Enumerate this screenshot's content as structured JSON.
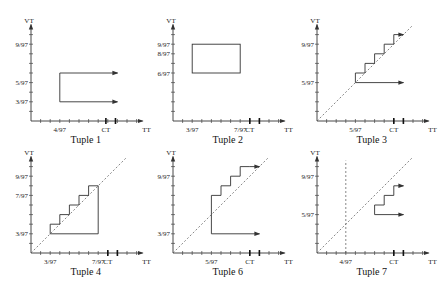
{
  "figure": {
    "axis_labels": {
      "x": "TT",
      "y": "VT",
      "ct": "CT"
    },
    "panels": [
      {
        "id": "tuple-1",
        "title": "Tuple 1",
        "origin": [
          31,
          121
        ],
        "step": 9.6,
        "y_ticks": 9,
        "x_ticks": 11,
        "x_labels": [
          {
            "tick": 3,
            "text": "4/97"
          }
        ],
        "y_labels": [
          {
            "tick": 8,
            "text": "9/97"
          },
          {
            "tick": 4,
            "text": "5/97"
          },
          {
            "tick": 2,
            "text": "3/97"
          }
        ],
        "ct_ticks": [
          7.8,
          8.8
        ],
        "diagonal": false,
        "vertical_dashed": null,
        "shapes": [
          {
            "type": "polyline",
            "points": [
              [
                3,
                5
              ],
              [
                3,
                2
              ]
            ]
          },
          {
            "type": "arrow",
            "from": [
              3,
              5
            ],
            "to": [
              9,
              5
            ]
          },
          {
            "type": "arrow",
            "from": [
              3,
              2
            ],
            "to": [
              9,
              2
            ]
          }
        ]
      },
      {
        "id": "tuple-2",
        "title": "Tuple 2",
        "origin": [
          173,
          121
        ],
        "step": 9.6,
        "y_ticks": 9,
        "x_ticks": 11,
        "x_labels": [
          {
            "tick": 2,
            "text": "3/97"
          },
          {
            "tick": 7,
            "text": "7/97"
          }
        ],
        "y_labels": [
          {
            "tick": 8,
            "text": "9/97"
          },
          {
            "tick": 7,
            "text": "8/97"
          },
          {
            "tick": 5,
            "text": "6/97"
          }
        ],
        "ct_ticks": [
          8,
          9
        ],
        "diagonal": false,
        "vertical_dashed": null,
        "shapes": [
          {
            "type": "rect",
            "x1": 2,
            "y1": 5,
            "x2": 7,
            "y2": 8
          }
        ]
      },
      {
        "id": "tuple-3",
        "title": "Tuple 3",
        "origin": [
          317,
          121
        ],
        "step": 9.6,
        "y_ticks": 9,
        "x_ticks": 11,
        "x_labels": [
          {
            "tick": 4,
            "text": "5/97"
          }
        ],
        "y_labels": [
          {
            "tick": 8,
            "text": "9/97"
          },
          {
            "tick": 4,
            "text": "5/97"
          }
        ],
        "ct_ticks": [
          8,
          9
        ],
        "diagonal": true,
        "vertical_dashed": null,
        "shapes": [
          {
            "type": "polyline",
            "points": [
              [
                4,
                4
              ],
              [
                4,
                5
              ],
              [
                5,
                5
              ],
              [
                5,
                6
              ],
              [
                6,
                6
              ],
              [
                6,
                7
              ],
              [
                7,
                7
              ],
              [
                7,
                8
              ],
              [
                8,
                8
              ],
              [
                8,
                9
              ]
            ]
          },
          {
            "type": "arrow",
            "from": [
              8,
              9
            ],
            "to": [
              9,
              9
            ]
          },
          {
            "type": "arrow",
            "from": [
              4,
              4
            ],
            "to": [
              9,
              4
            ]
          }
        ]
      },
      {
        "id": "tuple-4",
        "title": "Tuple 4",
        "origin": [
          31,
          253
        ],
        "step": 9.6,
        "y_ticks": 9,
        "x_ticks": 11,
        "x_labels": [
          {
            "tick": 2,
            "text": "3/97"
          },
          {
            "tick": 7,
            "text": "7/97"
          }
        ],
        "y_labels": [
          {
            "tick": 8,
            "text": "9/97"
          },
          {
            "tick": 6,
            "text": "7/97"
          },
          {
            "tick": 2,
            "text": "3/97"
          }
        ],
        "ct_ticks": [
          8,
          9
        ],
        "diagonal": true,
        "vertical_dashed": null,
        "shapes": [
          {
            "type": "polyline",
            "points": [
              [
                2,
                2
              ],
              [
                2,
                3
              ],
              [
                3,
                3
              ],
              [
                3,
                4
              ],
              [
                4,
                4
              ],
              [
                4,
                5
              ],
              [
                5,
                5
              ],
              [
                5,
                6
              ],
              [
                6,
                6
              ],
              [
                6,
                7
              ],
              [
                7,
                7
              ],
              [
                7,
                2
              ],
              [
                2,
                2
              ]
            ]
          }
        ]
      },
      {
        "id": "tuple-6",
        "title": "Tuple 6",
        "origin": [
          173,
          253
        ],
        "step": 9.6,
        "y_ticks": 9,
        "x_ticks": 11,
        "x_labels": [
          {
            "tick": 4,
            "text": "5/97"
          }
        ],
        "y_labels": [
          {
            "tick": 8,
            "text": "9/97"
          },
          {
            "tick": 2,
            "text": "3/97"
          }
        ],
        "ct_ticks": [
          8,
          9
        ],
        "diagonal": true,
        "vertical_dashed": null,
        "shapes": [
          {
            "type": "polyline",
            "points": [
              [
                4,
                2
              ],
              [
                4,
                6
              ],
              [
                5,
                6
              ],
              [
                5,
                7
              ],
              [
                6,
                7
              ],
              [
                6,
                8
              ],
              [
                7,
                8
              ],
              [
                7,
                9
              ],
              [
                8,
                9
              ]
            ]
          },
          {
            "type": "arrow",
            "from": [
              8,
              9
            ],
            "to": [
              9,
              9
            ]
          },
          {
            "type": "arrow",
            "from": [
              4,
              2
            ],
            "to": [
              9,
              2
            ]
          }
        ]
      },
      {
        "id": "tuple-7",
        "title": "Tuple 7",
        "origin": [
          317,
          253
        ],
        "step": 9.6,
        "y_ticks": 9,
        "x_ticks": 11,
        "x_labels": [
          {
            "tick": 3,
            "text": "4/97"
          }
        ],
        "y_labels": [
          {
            "tick": 8,
            "text": "9/97"
          },
          {
            "tick": 4,
            "text": "5/97"
          }
        ],
        "ct_ticks": [
          8,
          9
        ],
        "diagonal": true,
        "vertical_dashed": 3,
        "shapes": [
          {
            "type": "polyline",
            "points": [
              [
                6,
                4
              ],
              [
                6,
                5
              ],
              [
                7,
                5
              ],
              [
                7,
                6
              ],
              [
                8,
                6
              ],
              [
                8,
                7
              ]
            ]
          },
          {
            "type": "arrow",
            "from": [
              8,
              7
            ],
            "to": [
              9,
              7
            ]
          },
          {
            "type": "arrow",
            "from": [
              6,
              4
            ],
            "to": [
              9,
              4
            ]
          }
        ]
      }
    ]
  }
}
